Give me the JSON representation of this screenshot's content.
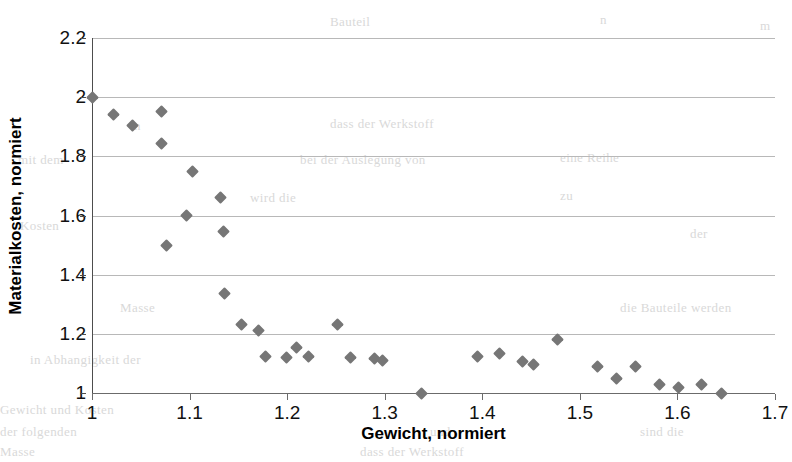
{
  "chart_data": {
    "type": "scatter",
    "title": "",
    "xlabel": "Gewicht, normiert",
    "ylabel": "Materialkosten, normiert",
    "xlim": [
      1.0,
      1.7
    ],
    "ylim": [
      1.0,
      2.2
    ],
    "xticks": [
      "1",
      "1.1",
      "1.2",
      "1.3",
      "1.4",
      "1.5",
      "1.6",
      "1.7"
    ],
    "xtick_values": [
      1.0,
      1.1,
      1.2,
      1.3,
      1.4,
      1.5,
      1.6,
      1.7
    ],
    "yticks": [
      "1",
      "1.2",
      "1.4",
      "1.6",
      "1.8",
      "2",
      "2.2"
    ],
    "ytick_values": [
      1.0,
      1.2,
      1.4,
      1.6,
      1.8,
      2.0,
      2.2
    ],
    "grid": "horizontal",
    "legend": "none",
    "marker": "diamond",
    "marker_color": "#767676",
    "series": [
      {
        "name": "Materialkosten vs Gewicht",
        "points": [
          [
            1.0,
            2.0
          ],
          [
            1.022,
            1.94
          ],
          [
            1.042,
            1.905
          ],
          [
            1.071,
            1.95
          ],
          [
            1.071,
            1.845
          ],
          [
            1.076,
            1.5
          ],
          [
            1.103,
            1.75
          ],
          [
            1.097,
            1.6
          ],
          [
            1.132,
            1.66
          ],
          [
            1.135,
            1.545
          ],
          [
            1.136,
            1.335
          ],
          [
            1.153,
            1.23
          ],
          [
            1.171,
            1.21
          ],
          [
            1.178,
            1.125
          ],
          [
            1.199,
            1.12
          ],
          [
            1.21,
            1.155
          ],
          [
            1.222,
            1.125
          ],
          [
            1.252,
            1.23
          ],
          [
            1.265,
            1.12
          ],
          [
            1.29,
            1.115
          ],
          [
            1.298,
            1.11
          ],
          [
            1.338,
            1.0
          ],
          [
            1.395,
            1.125
          ],
          [
            1.418,
            1.135
          ],
          [
            1.441,
            1.105
          ],
          [
            1.453,
            1.095
          ],
          [
            1.477,
            1.18
          ],
          [
            1.518,
            1.09
          ],
          [
            1.538,
            1.05
          ],
          [
            1.557,
            1.09
          ],
          [
            1.582,
            1.03
          ],
          [
            1.601,
            1.02
          ],
          [
            1.625,
            1.03
          ],
          [
            1.645,
            1.0
          ]
        ]
      }
    ]
  },
  "axes": {
    "y_title": "Materialkosten, normiert",
    "x_title": "Gewicht, normiert"
  },
  "background_text": {
    "items": [
      "n",
      "m",
      "zu",
      "in",
      "der",
      "Bauteil",
      "und",
      "sind  die",
      "eine  Reihe",
      "dass  der  Werkstoff",
      "bei  der  Auslegung  von",
      "Kosten",
      "mit  dem",
      "Masse",
      "die  Bauteile  werden",
      "in  Abhangigkeit  der",
      "wird  die",
      "Gewicht  und  Kosten",
      "der  folgenden"
    ]
  }
}
